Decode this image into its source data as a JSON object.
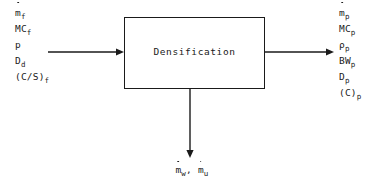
{
  "diagram": {
    "type": "process-block-diagram",
    "background_color": "#ffffff",
    "line_color": "#1a1a1a",
    "process_box": {
      "label": "Densification",
      "x": 124,
      "y": 17,
      "width": 141,
      "height": 72
    },
    "inputs": {
      "stream_label": "feed inputs",
      "arrow": {
        "from_x": 48,
        "to_x": 124,
        "y": 52,
        "direction": "right"
      },
      "items": [
        {
          "base": "m",
          "dot": true,
          "sub": "f",
          "text": "ṁf"
        },
        {
          "base": "MC",
          "dot": false,
          "sub": "f",
          "text": "MCf"
        },
        {
          "base": "p",
          "dot": false,
          "sub": "",
          "text": "p"
        },
        {
          "base": "D",
          "dot": false,
          "sub": "d",
          "text": "Dd"
        },
        {
          "base": "(C/S)",
          "dot": false,
          "sub": "f",
          "text": "(C/S)f"
        }
      ]
    },
    "outputs": {
      "stream_label": "product outputs",
      "arrow": {
        "from_x": 265,
        "to_x": 334,
        "y": 52,
        "direction": "right"
      },
      "items": [
        {
          "base": "m",
          "dot": true,
          "sub": "p",
          "text": "ṁp"
        },
        {
          "base": "MC",
          "dot": false,
          "sub": "p",
          "text": "MCp"
        },
        {
          "base": "ρ",
          "dot": false,
          "sub": "p",
          "text": "ρp"
        },
        {
          "base": "BW",
          "dot": false,
          "sub": "p",
          "text": "BWp"
        },
        {
          "base": "D",
          "dot": false,
          "sub": "p",
          "text": "Dp"
        },
        {
          "base": "(C)",
          "dot": false,
          "sub": "p",
          "text": "(C)p"
        }
      ]
    },
    "losses": {
      "stream_label": "loss streams",
      "arrow": {
        "x": 190,
        "from_y": 89,
        "to_y": 158,
        "direction": "down"
      },
      "items": [
        {
          "base": "m",
          "dot": true,
          "sub": "w",
          "text": "ṁw"
        },
        {
          "base": "m",
          "dot": true,
          "sub": "u",
          "text": "ṁu"
        }
      ],
      "separator": ","
    }
  }
}
